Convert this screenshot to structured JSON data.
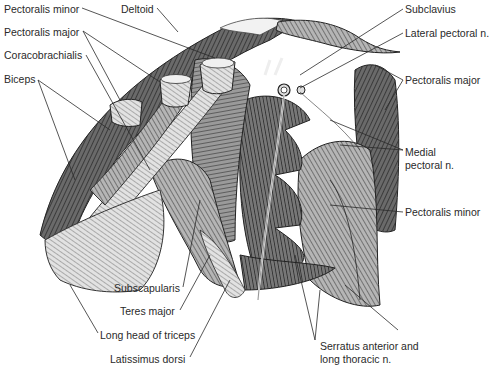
{
  "figure": {
    "type": "anatomical-illustration",
    "labels": [
      {
        "id": "pectoralis-minor-left",
        "text": "Pectoralis minor",
        "x": 4,
        "y": 3
      },
      {
        "id": "deltoid",
        "text": "Deltoid",
        "x": 121,
        "y": 3
      },
      {
        "id": "pectoralis-major-left",
        "text": "Pectoralis major",
        "x": 4,
        "y": 26
      },
      {
        "id": "coracobrachialis",
        "text": "Coracobrachialis",
        "x": 4,
        "y": 49
      },
      {
        "id": "biceps",
        "text": "Biceps",
        "x": 4,
        "y": 73
      },
      {
        "id": "subclavius",
        "text": "Subclavius",
        "x": 405,
        "y": 3
      },
      {
        "id": "lateral-pectoral-n",
        "text": "Lateral pectoral n.",
        "x": 405,
        "y": 27
      },
      {
        "id": "pectoralis-major-right",
        "text": "Pectoralis major",
        "x": 405,
        "y": 74
      },
      {
        "id": "medial-pectoral-n-1",
        "text": "Medial",
        "x": 405,
        "y": 146
      },
      {
        "id": "medial-pectoral-n-2",
        "text": "pectoral n.",
        "x": 405,
        "y": 159
      },
      {
        "id": "pectoralis-minor-right",
        "text": "Pectoralis minor",
        "x": 405,
        "y": 206
      },
      {
        "id": "subscapularis",
        "text": "Subscapularis",
        "x": 114,
        "y": 282
      },
      {
        "id": "teres-major",
        "text": "Teres major",
        "x": 120,
        "y": 305
      },
      {
        "id": "long-head-of-triceps",
        "text": "Long head of triceps",
        "x": 100,
        "y": 329
      },
      {
        "id": "latissimus-dorsi",
        "text": "Latissimus dorsi",
        "x": 110,
        "y": 353
      },
      {
        "id": "serratus-1",
        "text": "Serratus anterior and",
        "x": 320,
        "y": 340
      },
      {
        "id": "serratus-2",
        "text": "long thoracic n.",
        "x": 320,
        "y": 353
      }
    ]
  },
  "colors": {
    "ink": "#2a2a2a",
    "muscle_dark": "#5a5a5a",
    "muscle_mid": "#8c8c8c",
    "muscle_light": "#c8c8c8",
    "background": "#ffffff"
  }
}
